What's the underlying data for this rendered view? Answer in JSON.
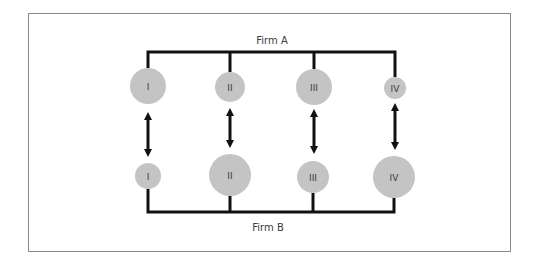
{
  "diagram": {
    "top_label": "Firm A",
    "bottom_label": "Firm B",
    "colors": {
      "node_fill": "#c4c4c4",
      "line": "#111111",
      "text": "#3a3a3a",
      "frame": "#8a8a8a"
    },
    "firm_a_units": [
      {
        "label": "I",
        "cx": 148,
        "cy": 86,
        "r": 18
      },
      {
        "label": "II",
        "cx": 230,
        "cy": 87,
        "r": 15
      },
      {
        "label": "III",
        "cx": 314,
        "cy": 87,
        "r": 18
      },
      {
        "label": "IV",
        "cx": 395,
        "cy": 88,
        "r": 11
      }
    ],
    "firm_b_units": [
      {
        "label": "I",
        "cx": 148,
        "cy": 176,
        "r": 13
      },
      {
        "label": "II",
        "cx": 230,
        "cy": 175,
        "r": 21
      },
      {
        "label": "III",
        "cx": 313,
        "cy": 177,
        "r": 16
      },
      {
        "label": "IV",
        "cx": 394,
        "cy": 177,
        "r": 21
      }
    ],
    "links": [
      {
        "from": "Firm A I",
        "to": "Firm B I",
        "type": "bidirectional"
      },
      {
        "from": "Firm A II",
        "to": "Firm B II",
        "type": "bidirectional"
      },
      {
        "from": "Firm A III",
        "to": "Firm B III",
        "type": "bidirectional"
      },
      {
        "from": "Firm A IV",
        "to": "Firm B IV",
        "type": "bidirectional"
      }
    ]
  }
}
